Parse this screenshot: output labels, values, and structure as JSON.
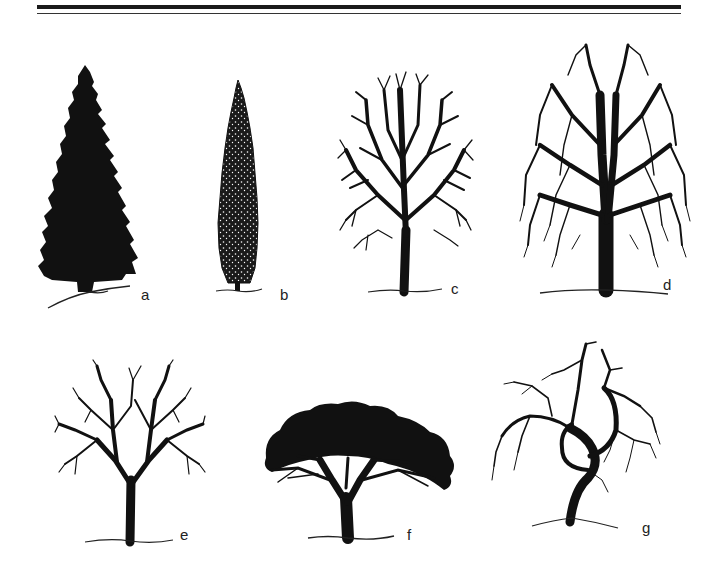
{
  "figure": {
    "trees": [
      {
        "label": "a",
        "form": "conical conifer silhouette"
      },
      {
        "label": "b",
        "form": "columnar / fastigiate conifer"
      },
      {
        "label": "c",
        "form": "ovoid deciduous crown, bare branches"
      },
      {
        "label": "d",
        "form": "broad weeping deciduous crown, bare branches"
      },
      {
        "label": "e",
        "form": "rounded deciduous crown, bare branches"
      },
      {
        "label": "f",
        "form": "spreading umbrella / flat-topped crown"
      },
      {
        "label": "g",
        "form": "irregular weeping crown with curved trunk"
      }
    ]
  },
  "colors": {
    "ink": "#111111",
    "background": "#ffffff"
  }
}
